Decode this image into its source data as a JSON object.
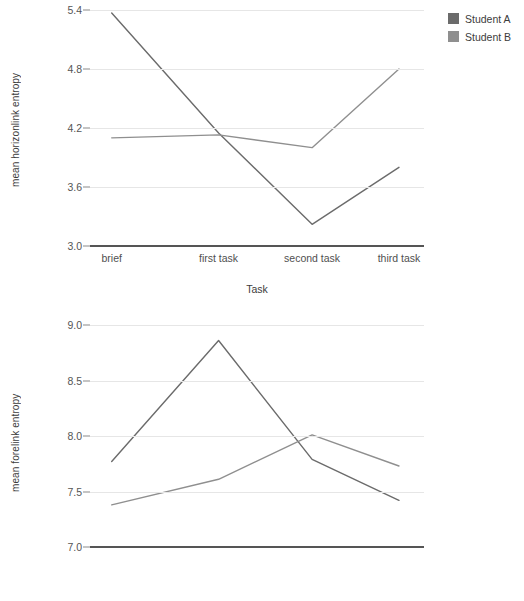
{
  "chart_data": [
    {
      "type": "line",
      "title": "",
      "xlabel": "Task",
      "ylabel": "mean horizonlink entropy",
      "categories": [
        "brief",
        "first task",
        "second task",
        "third task"
      ],
      "ylim": [
        3.0,
        5.4
      ],
      "yticks": [
        "5.4",
        "4.8",
        "4.2",
        "3.6",
        "3.0"
      ],
      "ytick_values": [
        5.4,
        4.8,
        4.2,
        3.6,
        3.0
      ],
      "grid": true,
      "legend_position": "right",
      "series": [
        {
          "name": "Student A",
          "color": "#6b6b6b",
          "values": [
            5.37,
            4.15,
            3.22,
            3.8
          ]
        },
        {
          "name": "Student B",
          "color": "#8f8f8f",
          "values": [
            4.1,
            4.13,
            4.0,
            4.8
          ]
        }
      ]
    },
    {
      "type": "line",
      "title": "",
      "xlabel": "Task",
      "ylabel": "mean forelink entropy",
      "categories": [
        "brief",
        "first task",
        "second task",
        "third task"
      ],
      "ylim": [
        7.0,
        9.0
      ],
      "yticks": [
        "9.0",
        "8.5",
        "8.0",
        "7.5",
        "7.0"
      ],
      "ytick_values": [
        9.0,
        8.5,
        8.0,
        7.5,
        7.0
      ],
      "grid": true,
      "legend_position": "right",
      "series": [
        {
          "name": "Student A",
          "color": "#6b6b6b",
          "values": [
            7.77,
            8.86,
            7.79,
            7.42
          ]
        },
        {
          "name": "Student B",
          "color": "#8f8f8f",
          "values": [
            7.38,
            7.61,
            8.01,
            7.73
          ]
        }
      ]
    }
  ],
  "top_chart": {
    "ylabel": "mean horizonlink entropy",
    "xlabel": "Task",
    "yticks": [
      "5.4",
      "4.8",
      "4.2",
      "3.6",
      "3.0"
    ],
    "xticks": [
      "brief",
      "first task",
      "second task",
      "third task"
    ],
    "legend": [
      {
        "label": "Student A",
        "color": "#6b6b6b"
      },
      {
        "label": "Student B",
        "color": "#8f8f8f"
      }
    ]
  },
  "bottom_chart": {
    "ylabel": "mean forelink entropy",
    "xlabel": "Task",
    "yticks": [
      "9.0",
      "8.5",
      "8.0",
      "7.5",
      "7.0"
    ],
    "xticks": [
      "brief",
      "first task",
      "second task",
      "third task"
    ],
    "legend": [
      {
        "label": "Student A",
        "color": "#6b6b6b"
      },
      {
        "label": "Student B",
        "color": "#8f8f8f"
      }
    ]
  }
}
